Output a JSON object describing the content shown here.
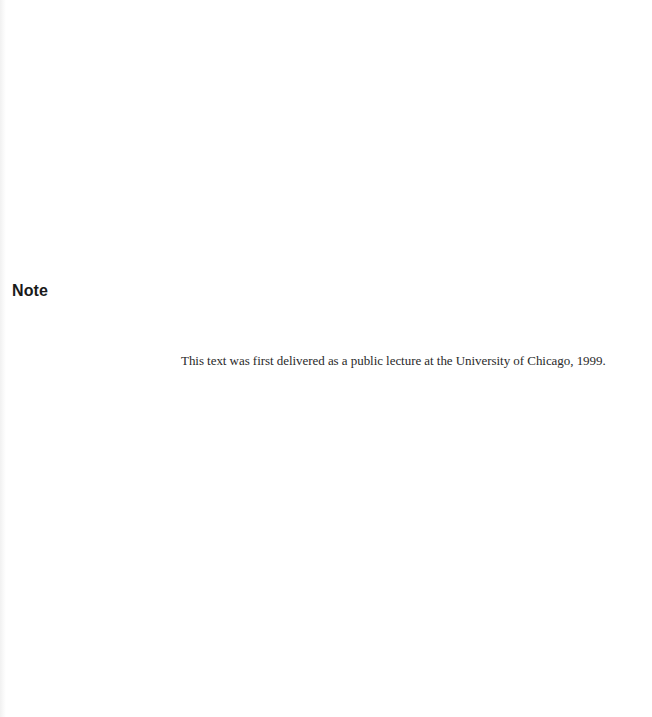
{
  "page": {
    "heading": "Note",
    "body_text": "This text was first delivered as a public lecture at the University of Chicago, 1999."
  },
  "colors": {
    "background": "#ffffff",
    "heading": "#1a1a1a",
    "body": "#2a2a2a"
  }
}
